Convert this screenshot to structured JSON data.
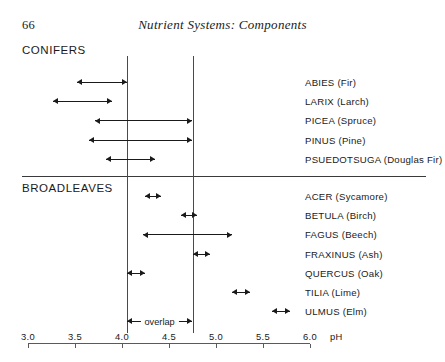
{
  "page": {
    "folio": "66",
    "running_head": "Nutrient Systems: Components"
  },
  "groups": {
    "conifers_label": "CONIFERS",
    "broadleaves_label": "BROADLEAVES"
  },
  "annotation": {
    "overlap_label": "overlap",
    "overlap_from": 4.05,
    "overlap_to": 4.75
  },
  "axis": {
    "unit_label": "pH",
    "min": 3.0,
    "max": 6.0,
    "ticks": [
      {
        "value": 3.0,
        "label": "3.0"
      },
      {
        "value": 3.5,
        "label": "3.5"
      },
      {
        "value": 4.0,
        "label": "4.0"
      },
      {
        "value": 4.5,
        "label": "4.5"
      },
      {
        "value": 5.0,
        "label": "5.0"
      },
      {
        "value": 5.5,
        "label": "5.5"
      },
      {
        "value": 6.0,
        "label": "6.0"
      }
    ]
  },
  "reference_lines": [
    4.05,
    4.75
  ],
  "chart_data": {
    "type": "bar",
    "title": "Nutrient Systems: Components",
    "xlabel": "pH",
    "ylabel": "",
    "xlim": [
      3.0,
      6.0
    ],
    "grid": false,
    "legend": "none",
    "orientation": "horizontal",
    "value_kind": "range",
    "reference_lines": [
      4.05,
      4.75
    ],
    "annotations": [
      {
        "text": "overlap",
        "from": 4.05,
        "to": 4.75
      }
    ],
    "groups": [
      {
        "name": "CONIFERS",
        "species": [
          {
            "label": "ABIES (Fir)",
            "from": 3.52,
            "to": 4.05
          },
          {
            "label": "LARIX (Larch)",
            "from": 3.27,
            "to": 3.89
          },
          {
            "label": "PICEA (Spruce)",
            "from": 3.71,
            "to": 4.75
          },
          {
            "label": "PINUS (Pine)",
            "from": 3.65,
            "to": 4.75
          },
          {
            "label": "PSUEDOTSUGA (Douglas Fir)",
            "from": 3.83,
            "to": 4.35
          }
        ]
      },
      {
        "name": "BROADLEAVES",
        "species": [
          {
            "label": "ACER (Sycamore)",
            "from": 4.24,
            "to": 4.41
          },
          {
            "label": "BETULA (Birch)",
            "from": 4.63,
            "to": 4.8
          },
          {
            "label": "FAGUS (Beech)",
            "from": 4.22,
            "to": 5.17
          },
          {
            "label": "FRAXINUS (Ash)",
            "from": 4.75,
            "to": 4.94
          },
          {
            "label": "QUERCUS (Oak)",
            "from": 4.05,
            "to": 4.24
          },
          {
            "label": "TILIA (Lime)",
            "from": 5.17,
            "to": 5.36
          },
          {
            "label": "ULMUS (Elm)",
            "from": 5.6,
            "to": 5.79
          }
        ]
      }
    ]
  }
}
